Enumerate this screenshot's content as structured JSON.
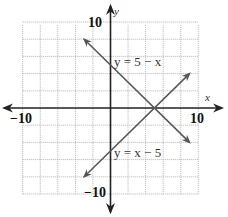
{
  "chart_data": {
    "type": "line",
    "title": "",
    "xlabel": "x",
    "ylabel": "y",
    "xlim": [
      -10,
      10
    ],
    "ylim": [
      -10,
      10
    ],
    "grid": true,
    "grid_step": 2,
    "tick_labels": {
      "x_min": "−10",
      "x_max": "10",
      "y_min": "−10",
      "y_max": "10"
    },
    "series": [
      {
        "name": "y = 5 − x",
        "equation": "y = 5 - x",
        "slope": -1,
        "intercept": 5,
        "x_range": [
          -3,
          9
        ],
        "points": [
          [
            -3,
            8
          ],
          [
            0,
            5
          ],
          [
            5,
            0
          ],
          [
            9,
            -4
          ]
        ]
      },
      {
        "name": "y = x − 5",
        "equation": "y = x - 5",
        "slope": 1,
        "intercept": -5,
        "x_range": [
          -3,
          9
        ],
        "points": [
          [
            -3,
            -8
          ],
          [
            0,
            -5
          ],
          [
            5,
            0
          ],
          [
            9,
            4
          ]
        ]
      }
    ],
    "intersection": [
      5,
      0
    ],
    "annotations": [
      {
        "text": "y = 5 − x",
        "near": [
          0.3,
          6
        ]
      },
      {
        "text": "y = x − 5",
        "near": [
          0.3,
          -5.5
        ]
      }
    ],
    "colors": {
      "axes": "#222222",
      "lines": "#555555",
      "grid": "#b0b0b0"
    }
  }
}
